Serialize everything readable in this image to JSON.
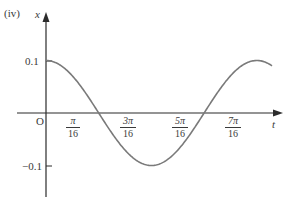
{
  "panel_label": "(iv)",
  "axes": {
    "y_label": "x",
    "x_label": "t",
    "origin_label": "O",
    "y_ticks": [
      "0.1",
      "−0.1"
    ],
    "x_ticks": [
      {
        "num": "π",
        "den": "16"
      },
      {
        "num": "3π",
        "den": "16"
      },
      {
        "num": "5π",
        "den": "16"
      },
      {
        "num": "7π",
        "den": "16"
      }
    ]
  },
  "colors": {
    "axis": "#2b2b2b",
    "curve": "#7a7a7a",
    "text": "#3a3a3a"
  },
  "chart_data": {
    "type": "line",
    "title": "",
    "panel": "(iv)",
    "xlabel": "t",
    "ylabel": "x",
    "function": "x = 0.1 cos(8t)",
    "x_tick_labels": [
      "π/16",
      "3π/16",
      "5π/16",
      "7π/16"
    ],
    "y_tick_labels": [
      "0.1",
      "−0.1"
    ],
    "ylim": [
      -0.1,
      0.1
    ],
    "grid": false,
    "legend": "none",
    "series": [
      {
        "name": "x(t)",
        "x": [
          "0",
          "π/16",
          "2π/16",
          "3π/16",
          "4π/16",
          "5π/16",
          "6π/16",
          "7π/16",
          "8π/16"
        ],
        "values": [
          0.1,
          0,
          -0.1,
          0,
          0.1,
          0,
          -0.1,
          0,
          0.1
        ]
      }
    ]
  }
}
